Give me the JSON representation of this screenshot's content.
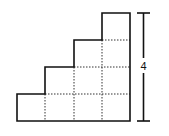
{
  "diagram": {
    "type": "staircase",
    "columns": 4,
    "column_heights": [
      1,
      2,
      3,
      4
    ],
    "unit_px": {
      "w": 28.25,
      "h": 27
    },
    "origin": {
      "x": 17,
      "y": 121
    },
    "dimension": {
      "label": "4",
      "meaning": "height in unit squares"
    },
    "colors": {
      "stroke": "#111111",
      "grid": "#333333",
      "background": "#ffffff"
    }
  }
}
